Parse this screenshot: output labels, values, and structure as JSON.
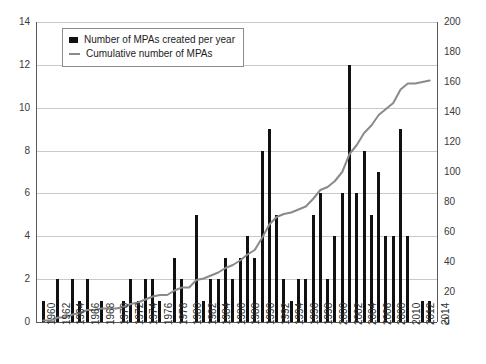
{
  "legend": {
    "bar_label": "Number of MPAs created per year",
    "line_label": "Cumulative number of MPAs",
    "bar_icon": "square-marker-icon",
    "line_icon": "line-marker-icon"
  },
  "axes": {
    "left_ticks": [
      "0",
      "2",
      "4",
      "6",
      "8",
      "10",
      "12",
      "14"
    ],
    "right_ticks": [
      "0",
      "20",
      "40",
      "60",
      "80",
      "100",
      "120",
      "140",
      "160",
      "180",
      "200"
    ],
    "x_ticks": [
      "1960",
      "1962",
      "1964",
      "1966",
      "1968",
      "1970",
      "1972",
      "1974",
      "1976",
      "1978",
      "1980",
      "1982",
      "1984",
      "1986",
      "1988",
      "1990",
      "1992",
      "1994",
      "1996",
      "1998",
      "2000",
      "2002",
      "2004",
      "2006",
      "2008",
      "2010",
      "2012",
      "2014"
    ]
  },
  "colors": {
    "bar": "#111111",
    "line": "#8a8a8a",
    "grid": "#c9c9c9",
    "axis": "#5a5a5a",
    "text": "#2f2f2f"
  },
  "chart_data": {
    "type": "bar",
    "title": "",
    "xlabel": "",
    "ylabel": "",
    "y2label": "",
    "ylim": [
      0,
      14
    ],
    "y2lim": [
      0,
      200
    ],
    "grid": true,
    "legend_position": "top-left",
    "x": [
      1960,
      1961,
      1962,
      1963,
      1964,
      1965,
      1966,
      1967,
      1968,
      1969,
      1970,
      1971,
      1972,
      1973,
      1974,
      1975,
      1976,
      1977,
      1978,
      1979,
      1980,
      1981,
      1982,
      1983,
      1984,
      1985,
      1986,
      1987,
      1988,
      1989,
      1990,
      1991,
      1992,
      1993,
      1994,
      1995,
      1996,
      1997,
      1998,
      1999,
      2000,
      2001,
      2002,
      2003,
      2004,
      2005,
      2006,
      2007,
      2008,
      2009,
      2010,
      2011,
      2012,
      2013
    ],
    "categories": [
      "1960",
      "1961",
      "1962",
      "1963",
      "1964",
      "1965",
      "1966",
      "1967",
      "1968",
      "1969",
      "1970",
      "1971",
      "1972",
      "1973",
      "1974",
      "1975",
      "1976",
      "1977",
      "1978",
      "1979",
      "1980",
      "1981",
      "1982",
      "1983",
      "1984",
      "1985",
      "1986",
      "1987",
      "1988",
      "1989",
      "1990",
      "1991",
      "1992",
      "1993",
      "1994",
      "1995",
      "1996",
      "1997",
      "1998",
      "1999",
      "2000",
      "2001",
      "2002",
      "2003",
      "2004",
      "2005",
      "2006",
      "2007",
      "2008",
      "2009",
      "2010",
      "2011",
      "2012",
      "2013"
    ],
    "series": [
      {
        "name": "Number of MPAs created per year",
        "type": "bar",
        "axis": "left",
        "values": [
          1,
          0,
          2,
          0,
          2,
          1,
          2,
          0,
          1,
          0,
          0,
          1,
          2,
          1,
          2,
          2,
          1,
          0,
          3,
          2,
          0,
          5,
          1,
          2,
          2,
          3,
          2,
          3,
          4,
          3,
          8,
          9,
          5,
          2,
          1,
          2,
          2,
          5,
          6,
          2,
          4,
          6,
          12,
          6,
          8,
          5,
          7,
          4,
          4,
          9,
          4,
          0,
          1,
          1
        ]
      },
      {
        "name": "Cumulative number of MPAs",
        "type": "line",
        "axis": "right",
        "values": [
          1,
          1,
          3,
          3,
          5,
          6,
          8,
          8,
          9,
          9,
          9,
          10,
          12,
          13,
          15,
          17,
          18,
          18,
          21,
          23,
          23,
          28,
          29,
          31,
          33,
          36,
          38,
          41,
          45,
          48,
          56,
          65,
          70,
          72,
          73,
          75,
          77,
          82,
          88,
          90,
          94,
          100,
          112,
          118,
          126,
          131,
          138,
          142,
          146,
          155,
          159,
          159,
          160,
          161
        ]
      }
    ]
  }
}
